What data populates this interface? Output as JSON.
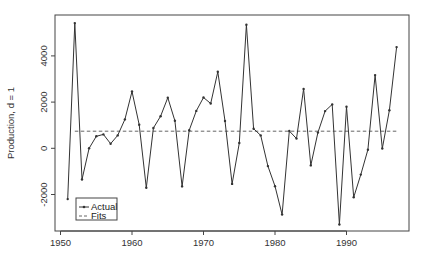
{
  "chart_data": {
    "type": "line",
    "title": "",
    "xlabel": "",
    "ylabel": "Production, d = 1",
    "xlim": [
      1948.7,
      1998.6
    ],
    "ylim": [
      -3650,
      5850
    ],
    "grid": false,
    "legend_position": "bottom-left",
    "x_ticks": [
      1950,
      1960,
      1970,
      1980,
      1990
    ],
    "y_ticks": [
      -2000,
      0,
      2000,
      4000
    ],
    "series": [
      {
        "name": "Actual",
        "style": "solid line with point markers",
        "x": [
          1951,
          1952,
          1953,
          1954,
          1955,
          1956,
          1957,
          1958,
          1959,
          1960,
          1961,
          1962,
          1963,
          1964,
          1965,
          1966,
          1967,
          1968,
          1969,
          1970,
          1971,
          1972,
          1973,
          1974,
          1975,
          1976,
          1977,
          1978,
          1979,
          1980,
          1981,
          1982,
          1983,
          1984,
          1985,
          1986,
          1987,
          1988,
          1989,
          1990,
          1991,
          1992,
          1993,
          1994,
          1995,
          1996,
          1997
        ],
        "values": [
          -2200,
          5420,
          -1350,
          0,
          520,
          600,
          200,
          560,
          1250,
          2460,
          1020,
          -1710,
          880,
          1390,
          2190,
          1190,
          -1650,
          780,
          1620,
          2200,
          1940,
          3310,
          1180,
          -1540,
          230,
          5350,
          850,
          560,
          -770,
          -1640,
          -2870,
          750,
          420,
          2570,
          -740,
          680,
          1610,
          1900,
          -3300,
          1800,
          -2120,
          -1140,
          -60,
          3170,
          -10,
          1650,
          4380
        ]
      },
      {
        "name": "Fits",
        "style": "dashed line",
        "x": [
          1952,
          1997
        ],
        "values": [
          740,
          740
        ]
      }
    ]
  },
  "legend": {
    "items": [
      {
        "label": "Actual"
      },
      {
        "label": "Fits"
      }
    ]
  },
  "axes": {
    "ylabel": "Production, d = 1",
    "x_tick_labels": [
      "1950",
      "1960",
      "1970",
      "1980",
      "1990"
    ],
    "y_tick_labels": [
      "-2000",
      "0",
      "2000",
      "4000"
    ]
  },
  "colors": {
    "line": "#333333",
    "frame": "#444444",
    "fits": "#555555"
  }
}
